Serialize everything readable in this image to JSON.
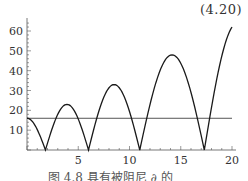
{
  "equation_number": "(4.20)",
  "caption": "图 4.8  具有被阻尼 ∂ 的",
  "chart_data": {
    "type": "line",
    "title": "",
    "xlabel": "",
    "ylabel": "",
    "xlim": [
      0,
      20
    ],
    "ylim": [
      0,
      65
    ],
    "x_ticks": [
      5,
      10,
      15,
      20
    ],
    "y_ticks": [
      10,
      20,
      30,
      40,
      50,
      60
    ],
    "grid": false,
    "legend": null,
    "series": [
      {
        "name": "curve",
        "x": [
          0,
          0.5,
          1.0,
          1.5,
          1.8,
          2.3,
          3.0,
          3.9,
          4.8,
          5.5,
          6.0,
          6.6,
          7.4,
          8.5,
          9.6,
          10.4,
          11.0,
          11.8,
          13.0,
          14.3,
          15.6,
          16.6,
          17.3,
          18.0,
          19.0,
          20.0
        ],
        "y": [
          16,
          13.5,
          8.5,
          3.0,
          0,
          11,
          19.5,
          23,
          19.5,
          11,
          0,
          17,
          28,
          33,
          28,
          17,
          0,
          26,
          41,
          48,
          41,
          25,
          0,
          31,
          48,
          62
        ]
      },
      {
        "name": "horizontal-line",
        "x": [
          0,
          20
        ],
        "y": [
          16,
          16
        ]
      }
    ]
  },
  "axes": {
    "x_tick_labels": [
      "5",
      "10",
      "15",
      "20"
    ],
    "y_tick_labels": [
      "10",
      "20",
      "30",
      "40",
      "50",
      "60"
    ]
  }
}
